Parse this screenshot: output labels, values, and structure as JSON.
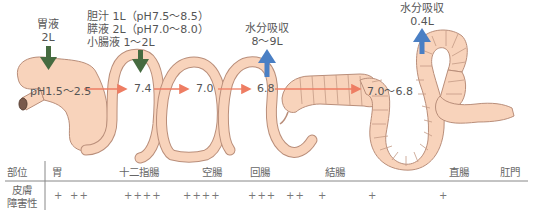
{
  "colors": {
    "tract_fill": "#f8d3bb",
    "tract_stroke": "#b98e7a",
    "secretion_arrow": "#466b40",
    "absorption_arrow": "#4a7fc4",
    "flow_arrow": "#ee7d63",
    "text": "#555555",
    "table_line": "#888888"
  },
  "secretions": [
    {
      "id": "gastric",
      "label_line1": "胃液",
      "label_line2": "2L",
      "icon": "arrow-down-green"
    },
    {
      "id": "duodenal",
      "line1": "胆汁 1L（pH7.5〜8.5）",
      "line2": "膵液 2L（pH7.0〜8.0）",
      "line3": "小腸液 1〜2L",
      "icon": "arrow-down-green"
    }
  ],
  "absorptions": [
    {
      "id": "small-intestine",
      "line1": "水分吸収",
      "line2": "8〜9L",
      "icon": "arrow-up-blue"
    },
    {
      "id": "colon",
      "line1": "水分吸収",
      "line2": "0.4L",
      "icon": "arrow-up-blue"
    }
  ],
  "ph_values": [
    {
      "site": "胃",
      "value": "pH1.5〜2.5"
    },
    {
      "site": "十二指腸",
      "value": "7.4"
    },
    {
      "site": "空腸",
      "value": "7.0"
    },
    {
      "site": "回腸",
      "value": "6.8"
    },
    {
      "site": "結腸",
      "value": "7.0〜6.8"
    }
  ],
  "table": {
    "row_headers": {
      "site": "部位",
      "skin_damage_line1": "皮膚",
      "skin_damage_line2": "障害性"
    },
    "sites": [
      "胃",
      "十二指腸",
      "空腸",
      "回腸",
      "結腸",
      "直腸",
      "肛門"
    ],
    "skin_damage": [
      "+",
      "++",
      "++++",
      "++++",
      "+++",
      "++",
      "+",
      "+",
      "+"
    ]
  }
}
